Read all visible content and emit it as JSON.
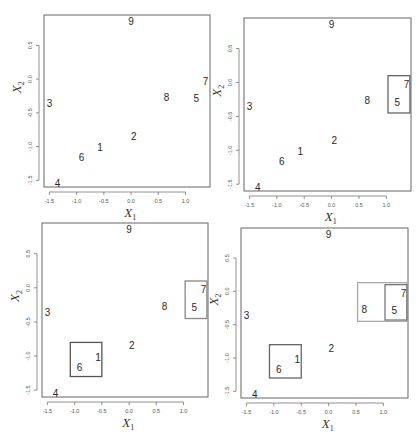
{
  "chart_data": {
    "type": "scatter",
    "title": "",
    "layout": "2x2 grid of panels showing successive hierarchical clustering merges",
    "xlabel": "X1",
    "ylabel": "X2",
    "xlim": [
      -1.6,
      1.45
    ],
    "ylim": [
      -1.6,
      0.95
    ],
    "xticks": [
      "-1.5",
      "-1.0",
      "-0.5",
      "0.0",
      "0.5",
      "1.0"
    ],
    "yticks": [
      "-1.5",
      "-1.0",
      "-0.5",
      "0.0",
      "0.5"
    ],
    "grid": false,
    "legend": null,
    "points": [
      {
        "label": "1",
        "x": -0.57,
        "y": -1.02
      },
      {
        "label": "2",
        "x": 0.05,
        "y": -0.85
      },
      {
        "label": "3",
        "x": -1.5,
        "y": -0.36
      },
      {
        "label": "4",
        "x": -1.35,
        "y": -1.55
      },
      {
        "label": "5",
        "x": 1.2,
        "y": -0.29
      },
      {
        "label": "6",
        "x": -0.91,
        "y": -1.17
      },
      {
        "label": "7",
        "x": 1.37,
        "y": -0.03
      },
      {
        "label": "8",
        "x": 0.65,
        "y": -0.27
      },
      {
        "label": "9",
        "x": 0.0,
        "y": 0.85
      }
    ],
    "panels": [
      {
        "position": "top-left",
        "clusters": []
      },
      {
        "position": "top-right",
        "clusters": [
          {
            "members": [
              "5",
              "7"
            ],
            "x0": 1.03,
            "x1": 1.43,
            "y0": -0.45,
            "y1": 0.1,
            "color": "#666666"
          }
        ]
      },
      {
        "position": "bottom-left",
        "clusters": [
          {
            "members": [
              "5",
              "7"
            ],
            "x0": 1.03,
            "x1": 1.43,
            "y0": -0.45,
            "y1": 0.1,
            "color": "#888888"
          },
          {
            "members": [
              "1",
              "6"
            ],
            "x0": -1.08,
            "x1": -0.5,
            "y0": -1.3,
            "y1": -0.8,
            "color": "#555555"
          }
        ]
      },
      {
        "position": "bottom-right",
        "clusters": [
          {
            "members": [
              "1",
              "6"
            ],
            "x0": -1.08,
            "x1": -0.5,
            "y0": -1.3,
            "y1": -0.8,
            "color": "#666666"
          },
          {
            "members": [
              "5",
              "7",
              "8"
            ],
            "x0": 0.53,
            "x1": 1.43,
            "y0": -0.45,
            "y1": 0.13,
            "color": "#aaaaaa"
          },
          {
            "members": [
              "5",
              "7"
            ],
            "x0": 1.03,
            "x1": 1.43,
            "y0": -0.43,
            "y1": 0.1,
            "color": "#777777"
          }
        ]
      }
    ]
  },
  "layout_px": {
    "panels": [
      {
        "left": 44,
        "top": 15,
        "width": 166,
        "height": 172
      },
      {
        "left": 244,
        "top": 18,
        "width": 167,
        "height": 173
      },
      {
        "left": 42,
        "top": 223,
        "width": 166,
        "height": 174
      },
      {
        "left": 241,
        "top": 228,
        "width": 167,
        "height": 170
      }
    ]
  },
  "axis_labels": {
    "x_main": "X",
    "x_sub": "1",
    "y_main": "X",
    "y_sub": "2"
  }
}
